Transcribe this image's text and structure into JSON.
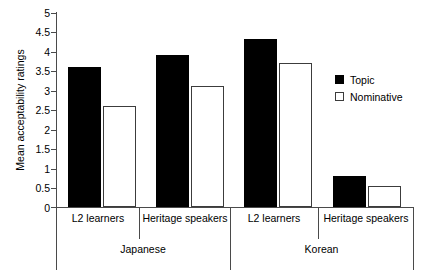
{
  "chart_data": {
    "type": "bar",
    "title": "",
    "xlabel": "",
    "ylabel": "Mean acceptability ratings",
    "ylim": [
      0,
      5
    ],
    "ytick_labels": [
      "5",
      "4.5",
      "4",
      "3.5",
      "3",
      "2.5",
      "2",
      "1.5",
      "1",
      "0.5",
      "0"
    ],
    "ytick_values": [
      5,
      4.5,
      4,
      3.5,
      3,
      2.5,
      2,
      1.5,
      1,
      0.5,
      0
    ],
    "grid": false,
    "legend_position": "right",
    "groups": [
      {
        "label": "Japanese",
        "categories": [
          "L2 learners",
          "Heritage speakers"
        ]
      },
      {
        "label": "Korean",
        "categories": [
          "L2 learners",
          "Heritage speakers"
        ]
      }
    ],
    "categories": [
      "Japanese / L2 learners",
      "Japanese / Heritage speakers",
      "Korean / L2 learners",
      "Korean / Heritage speakers"
    ],
    "series": [
      {
        "name": "Topic",
        "color": "#000000",
        "values": [
          3.6,
          3.9,
          4.3,
          0.8
        ]
      },
      {
        "name": "Nominative",
        "color": "#ffffff",
        "values": [
          2.6,
          3.1,
          3.7,
          0.55
        ]
      }
    ]
  },
  "legend": {
    "items": [
      {
        "label": "Topic",
        "swatch": "filled-square-icon"
      },
      {
        "label": "Nominative",
        "swatch": "open-square-icon"
      }
    ]
  },
  "axis": {
    "y_label": "Mean acceptability ratings",
    "ticks": [
      "5",
      "4.5",
      "4",
      "3.5",
      "3",
      "2.5",
      "2",
      "1.5",
      "1",
      "0.5",
      "0"
    ]
  },
  "xaxis": {
    "sub_labels": [
      "L2 learners",
      "Heritage speakers",
      "L2 learners",
      "Heritage speakers"
    ],
    "group_labels": [
      "Japanese",
      "Korean"
    ]
  }
}
